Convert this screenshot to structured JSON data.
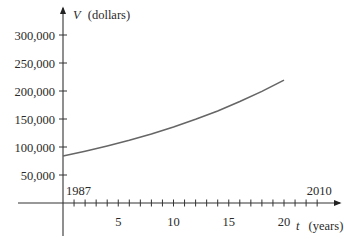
{
  "chart_data": {
    "type": "line",
    "title": "",
    "xlabel": {
      "var": "t",
      "unit": "(years)"
    },
    "ylabel": {
      "var": "V",
      "unit": "(dollars)"
    },
    "x_ticks": [
      5,
      10,
      15,
      20
    ],
    "x_tick_labels": [
      "5",
      "10",
      "15",
      "20"
    ],
    "x_minor_ticks": [
      1,
      2,
      3,
      4,
      5,
      6,
      7,
      8,
      9,
      10,
      11,
      12,
      13,
      14,
      15,
      16,
      17,
      18,
      19,
      20,
      21,
      22,
      23
    ],
    "y_ticks": [
      50000,
      100000,
      150000,
      200000,
      250000,
      300000
    ],
    "y_tick_labels": [
      "50,000",
      "100,000",
      "150,000",
      "200,000",
      "250,000",
      "300,000"
    ],
    "annotations": [
      {
        "text": "1987",
        "at_t": 0
      },
      {
        "text": "2010",
        "at_t": 23
      }
    ],
    "xlim": [
      0,
      24
    ],
    "ylim": [
      0,
      320000
    ],
    "grid": false,
    "legend": null,
    "series": [
      {
        "name": "V(t)",
        "x": [
          0,
          2,
          4,
          6,
          8,
          10,
          12,
          14,
          16,
          18,
          20
        ],
        "values": [
          84000,
          92500,
          101800,
          112000,
          123300,
          135700,
          149400,
          164400,
          181000,
          199200,
          219500
        ]
      }
    ]
  }
}
